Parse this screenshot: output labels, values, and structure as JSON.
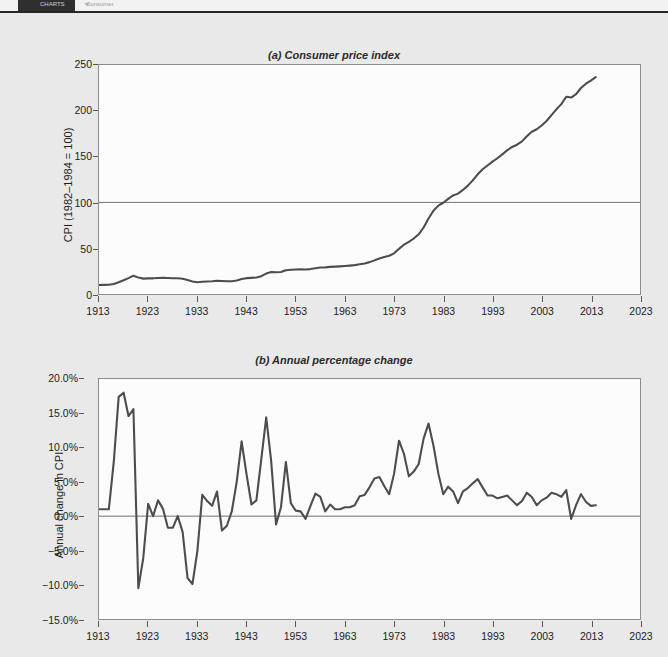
{
  "toolbar": {
    "app_label": "CHARTS",
    "tab_label": "Consumer",
    "mid_label": "",
    "caret_icon": "chevron-down-icon"
  },
  "figure": {
    "panel_a_title": "(a) Consumer price index",
    "panel_b_title": "(b) Annual percentage change",
    "line_color": "#4d4d4d",
    "plot_background": "#fcfcfc",
    "page_background": "#e9e9e9"
  },
  "chart_data": [
    {
      "type": "line",
      "title": "(a) Consumer price index",
      "xlabel": "",
      "ylabel": "CPI (1982–1984 = 100)",
      "xlim": [
        1913,
        2023
      ],
      "ylim": [
        0,
        250
      ],
      "yticks": [
        "0",
        "50",
        "100",
        "150",
        "200",
        "250"
      ],
      "ytick_values": [
        0,
        50,
        100,
        150,
        200,
        250
      ],
      "xticks": [
        "1913",
        "1923",
        "1933",
        "1943",
        "1953",
        "1963",
        "1973",
        "1983",
        "1993",
        "2003",
        "2013",
        "2023"
      ],
      "xtick_values": [
        1913,
        1923,
        1933,
        1943,
        1953,
        1963,
        1973,
        1983,
        1993,
        2003,
        2013,
        2023
      ],
      "grid": false,
      "reference_line": 100,
      "legend": null,
      "x": [
        1913,
        1914,
        1915,
        1916,
        1917,
        1918,
        1919,
        1920,
        1921,
        1922,
        1923,
        1924,
        1925,
        1926,
        1927,
        1928,
        1929,
        1930,
        1931,
        1932,
        1933,
        1934,
        1935,
        1936,
        1937,
        1938,
        1939,
        1940,
        1941,
        1942,
        1943,
        1944,
        1945,
        1946,
        1947,
        1948,
        1949,
        1950,
        1951,
        1952,
        1953,
        1954,
        1955,
        1956,
        1957,
        1958,
        1959,
        1960,
        1961,
        1962,
        1963,
        1964,
        1965,
        1966,
        1967,
        1968,
        1969,
        1970,
        1971,
        1972,
        1973,
        1974,
        1975,
        1976,
        1977,
        1978,
        1979,
        1980,
        1981,
        1982,
        1983,
        1984,
        1985,
        1986,
        1987,
        1988,
        1989,
        1990,
        1991,
        1992,
        1993,
        1994,
        1995,
        1996,
        1997,
        1998,
        1999,
        2000,
        2001,
        2002,
        2003,
        2004,
        2005,
        2006,
        2007,
        2008,
        2009,
        2010,
        2011,
        2012,
        2013,
        2014
      ],
      "values": [
        9.9,
        10.0,
        10.1,
        10.9,
        12.8,
        15.1,
        17.3,
        20.0,
        17.9,
        16.8,
        17.1,
        17.1,
        17.5,
        17.7,
        17.4,
        17.2,
        17.2,
        16.7,
        15.2,
        13.6,
        12.9,
        13.4,
        13.7,
        13.9,
        14.4,
        14.1,
        13.9,
        14.0,
        14.7,
        16.3,
        17.3,
        17.6,
        18.0,
        19.5,
        22.3,
        24.0,
        23.8,
        24.1,
        26.0,
        26.5,
        26.7,
        26.9,
        26.8,
        27.2,
        28.1,
        28.9,
        29.1,
        29.6,
        29.9,
        30.2,
        30.6,
        31.0,
        31.5,
        32.4,
        33.4,
        34.8,
        36.7,
        38.8,
        40.5,
        41.8,
        44.4,
        49.3,
        53.8,
        56.9,
        60.6,
        65.2,
        72.6,
        82.4,
        90.9,
        96.5,
        99.6,
        103.9,
        107.6,
        109.6,
        113.6,
        118.3,
        124.0,
        130.7,
        136.2,
        140.3,
        144.5,
        148.2,
        152.4,
        156.9,
        160.5,
        163.0,
        166.6,
        172.2,
        177.1,
        179.9,
        184.0,
        188.9,
        195.3,
        201.6,
        207.3,
        215.3,
        214.5,
        218.1,
        224.9,
        229.6,
        233.0,
        236.7
      ]
    },
    {
      "type": "line",
      "title": "(b) Annual percentage change",
      "xlabel": "",
      "ylabel": "Annual change in CPI",
      "xlim": [
        1913,
        2023
      ],
      "ylim": [
        -15,
        20
      ],
      "yticks": [
        "−15.0%",
        "−10.0%",
        "−5.0%",
        "0.0%",
        "5.0%",
        "10.0%",
        "15.0%",
        "20.0%"
      ],
      "ytick_values": [
        -15,
        -10,
        -5,
        0,
        5,
        10,
        15,
        20
      ],
      "xticks": [
        "1913",
        "1923",
        "1933",
        "1943",
        "1953",
        "1963",
        "1973",
        "1983",
        "1993",
        "2003",
        "2013",
        "2023"
      ],
      "xtick_values": [
        1913,
        1923,
        1933,
        1943,
        1953,
        1963,
        1973,
        1983,
        1993,
        2003,
        2013,
        2023
      ],
      "grid": false,
      "reference_line": 0,
      "legend": null,
      "x": [
        1913,
        1914,
        1915,
        1916,
        1917,
        1918,
        1919,
        1920,
        1921,
        1922,
        1923,
        1924,
        1925,
        1926,
        1927,
        1928,
        1929,
        1930,
        1931,
        1932,
        1933,
        1934,
        1935,
        1936,
        1937,
        1938,
        1939,
        1940,
        1941,
        1942,
        1943,
        1944,
        1945,
        1946,
        1947,
        1948,
        1949,
        1950,
        1951,
        1952,
        1953,
        1954,
        1955,
        1956,
        1957,
        1958,
        1959,
        1960,
        1961,
        1962,
        1963,
        1964,
        1965,
        1966,
        1967,
        1968,
        1969,
        1970,
        1971,
        1972,
        1973,
        1974,
        1975,
        1976,
        1977,
        1978,
        1979,
        1980,
        1981,
        1982,
        1983,
        1984,
        1985,
        1986,
        1987,
        1988,
        1989,
        1990,
        1991,
        1992,
        1993,
        1994,
        1995,
        1996,
        1997,
        1998,
        1999,
        2000,
        2001,
        2002,
        2003,
        2004,
        2005,
        2006,
        2007,
        2008,
        2009,
        2010,
        2011,
        2012,
        2013,
        2014
      ],
      "values": [
        1.0,
        1.0,
        1.0,
        7.9,
        17.4,
        18.0,
        14.6,
        15.6,
        -10.5,
        -6.1,
        1.8,
        0.0,
        2.3,
        1.1,
        -1.7,
        -1.7,
        0.0,
        -2.3,
        -9.0,
        -9.9,
        -5.1,
        3.1,
        2.2,
        1.5,
        3.6,
        -2.1,
        -1.4,
        0.7,
        5.0,
        10.9,
        6.1,
        1.7,
        2.3,
        8.3,
        14.4,
        8.1,
        -1.2,
        1.3,
        7.9,
        1.9,
        0.8,
        0.7,
        -0.4,
        1.5,
        3.3,
        2.8,
        0.7,
        1.7,
        1.0,
        1.0,
        1.3,
        1.3,
        1.6,
        2.9,
        3.1,
        4.2,
        5.5,
        5.7,
        4.4,
        3.2,
        6.2,
        11.0,
        9.1,
        5.8,
        6.5,
        7.6,
        11.3,
        13.5,
        10.3,
        6.2,
        3.2,
        4.3,
        3.6,
        1.9,
        3.6,
        4.1,
        4.8,
        5.4,
        4.2,
        3.0,
        3.0,
        2.6,
        2.8,
        3.0,
        2.3,
        1.6,
        2.2,
        3.4,
        2.8,
        1.6,
        2.3,
        2.7,
        3.4,
        3.2,
        2.8,
        3.8,
        -0.4,
        1.6,
        3.2,
        2.1,
        1.5,
        1.6
      ]
    }
  ]
}
